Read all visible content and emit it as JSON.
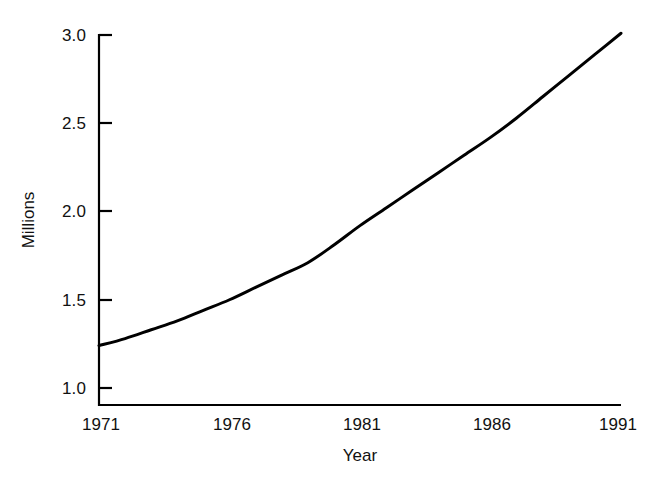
{
  "chart_data": {
    "type": "line",
    "title": "",
    "subtitle": "",
    "xlabel": "Year",
    "ylabel": "Millions",
    "xlim": [
      1971,
      1991
    ],
    "ylim": [
      1.0,
      3.05
    ],
    "grid": false,
    "legend": false,
    "legend_position": "none",
    "x_ticks": [
      1971,
      1976,
      1981,
      1986,
      1991
    ],
    "x_tick_labels": [
      "1971",
      "1976",
      "1981",
      "1986",
      "1991"
    ],
    "x_tick_marks": false,
    "y_ticks": [
      1.0,
      1.5,
      2.0,
      2.5,
      3.0
    ],
    "y_tick_labels": [
      "1.0",
      "1.5",
      "2.0",
      "2.5",
      "3.0"
    ],
    "y_tick_marks": true,
    "line_color": "#000000",
    "line_width_px": 3,
    "axis_color": "#000000",
    "background_color": "#ffffff",
    "series": [
      {
        "name": "Millions",
        "x": [
          1971,
          1972,
          1973,
          1974,
          1975,
          1976,
          1977,
          1978,
          1979,
          1980,
          1981,
          1982,
          1983,
          1984,
          1985,
          1986,
          1987,
          1988,
          1989,
          1990,
          1991
        ],
        "values": [
          1.24,
          1.28,
          1.33,
          1.38,
          1.44,
          1.5,
          1.57,
          1.64,
          1.71,
          1.81,
          1.92,
          2.02,
          2.12,
          2.22,
          2.32,
          2.42,
          2.53,
          2.65,
          2.77,
          2.89,
          3.01
        ]
      }
    ],
    "annotations": []
  },
  "figure": {
    "x_axis_title": "Year",
    "y_axis_title": "Millions"
  }
}
